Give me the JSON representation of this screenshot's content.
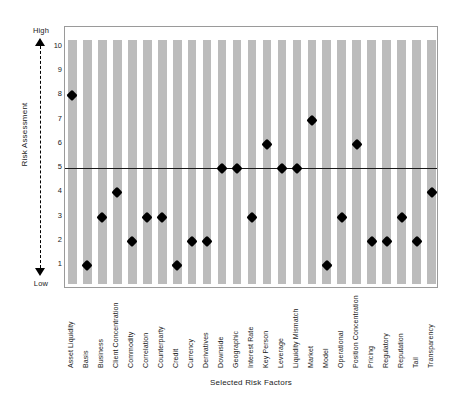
{
  "chart_data": {
    "type": "scatter",
    "title": "",
    "xlabel": "Selected Risk Factors",
    "ylabel": "Risk Assessment",
    "ylim": [
      1,
      10
    ],
    "yticks": [
      10,
      9,
      8,
      7,
      6,
      5,
      4,
      3,
      2,
      1
    ],
    "y_direction_high_label": "High",
    "y_direction_low_label": "Low",
    "grid": false,
    "background_bands": true,
    "band_color": "#bcbcbc",
    "marker": "diamond",
    "marker_color": "#000000",
    "threshold_line": {
      "value": 5,
      "color": "#1a1a1a"
    },
    "legend_position": "none",
    "categories": [
      "Asset Liquidity",
      "Basis",
      "Business",
      "Client Concentration",
      "Commodity",
      "Correlation",
      "Counterparty",
      "Credit",
      "Currency",
      "Derivatives",
      "Downside",
      "Geographic",
      "Interest Rate",
      "Key Person",
      "Leverage",
      "Liquidity Mismatch",
      "Market",
      "Model",
      "Operational",
      "Position Concentration",
      "Pricing",
      "Regulatory",
      "Reputation",
      "Tail",
      "Transparency"
    ],
    "values": [
      8,
      1,
      3,
      4,
      2,
      3,
      3,
      1,
      2,
      2,
      5,
      5,
      3,
      6,
      5,
      5,
      7,
      1,
      3,
      6,
      2,
      2,
      3,
      2,
      4
    ]
  }
}
